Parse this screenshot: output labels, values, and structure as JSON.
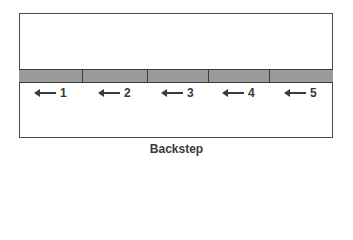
{
  "diagram": {
    "caption": "Backstep",
    "segments": [
      {
        "label": "1",
        "width": 64,
        "arrow_direction": "left",
        "marker_x": 38
      },
      {
        "label": "2",
        "width": 65,
        "arrow_direction": "left",
        "marker_x": 102
      },
      {
        "label": "3",
        "width": 61,
        "arrow_direction": "left",
        "marker_x": 165
      },
      {
        "label": "4",
        "width": 61,
        "arrow_direction": "left",
        "marker_x": 226
      },
      {
        "label": "5",
        "width": 63,
        "arrow_direction": "left",
        "marker_x": 288
      }
    ],
    "colors": {
      "band_fill": "#9a9a9a",
      "stroke": "#3c3c3c",
      "text": "#3a3a3a"
    }
  }
}
